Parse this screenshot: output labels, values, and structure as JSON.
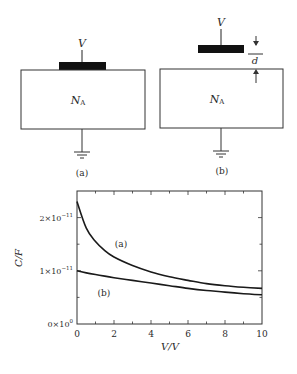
{
  "diagrams": [
    {
      "id": "a",
      "caption": "(a)",
      "voltage_label": "V",
      "substrate_label": "N",
      "substrate_sub": "A",
      "gate": "on-surface"
    },
    {
      "id": "b",
      "caption": "(b)",
      "voltage_label": "V",
      "substrate_label": "N",
      "substrate_sub": "A",
      "gate": "separated",
      "gap_label": "d"
    }
  ],
  "chart_data": {
    "type": "line",
    "title": "",
    "xlabel": "V/V",
    "ylabel": "C/F",
    "xlim": [
      0,
      10
    ],
    "ylim": [
      0,
      2.5e-11
    ],
    "x_ticks": [
      "0",
      "2",
      "4",
      "6",
      "8",
      "10"
    ],
    "y_ticks": [
      {
        "base": "0×10",
        "exp": "0"
      },
      {
        "base": "1×10",
        "exp": "−11"
      },
      {
        "base": "2×10",
        "exp": "−11"
      }
    ],
    "grid": false,
    "legend": "inline labels",
    "x": [
      0,
      0.5,
      1,
      1.5,
      2,
      3,
      4,
      5,
      6,
      7,
      8,
      9,
      10
    ],
    "series": [
      {
        "name": "(a)",
        "values": [
          2.3e-11,
          1.8e-11,
          1.55e-11,
          1.38e-11,
          1.26e-11,
          1.1e-11,
          9.8e-12,
          8.9e-12,
          8.2e-12,
          7.6e-12,
          7.2e-12,
          6.9e-12,
          6.7e-12
        ]
      },
      {
        "name": "(b)",
        "values": [
          1e-11,
          9.6e-12,
          9.3e-12,
          9e-12,
          8.7e-12,
          8.2e-12,
          7.7e-12,
          7.2e-12,
          6.7e-12,
          6.3e-12,
          6e-12,
          5.7e-12,
          5.5e-12
        ]
      }
    ],
    "annotations": [
      {
        "text": "(a)",
        "x": 2.1,
        "y": 1.6e-11
      },
      {
        "text": "(b)",
        "x": 1.2,
        "y": 5.5e-12
      }
    ]
  }
}
